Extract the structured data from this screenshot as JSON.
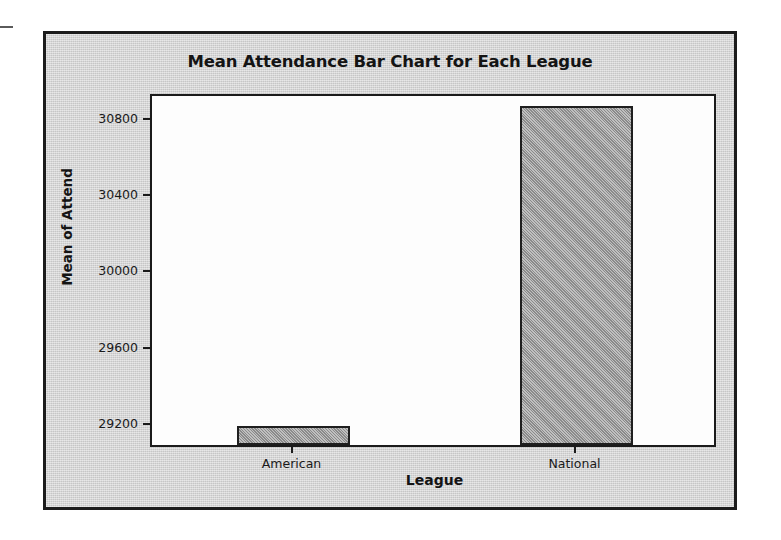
{
  "chart_data": {
    "type": "bar",
    "title": "Mean Attendance Bar Chart for Each League",
    "xlabel": "League",
    "ylabel": "Mean of Attend",
    "categories": [
      "American",
      "National"
    ],
    "values": [
      29178,
      30859
    ],
    "ylim": [
      29080,
      30930
    ],
    "yticks": [
      29200,
      29600,
      30000,
      30400,
      30800
    ],
    "ytick_labels": [
      "29200",
      "29600",
      "30000",
      "30400",
      "30800"
    ],
    "grid": false,
    "legend": "none",
    "bar_color": "#9a9a9a",
    "bar_edge_color": "#1f1f1f",
    "panel_color": "#d4d4d4",
    "plot_bg_color": "#fdfdfd",
    "axis_color": "#1b1b1b"
  }
}
